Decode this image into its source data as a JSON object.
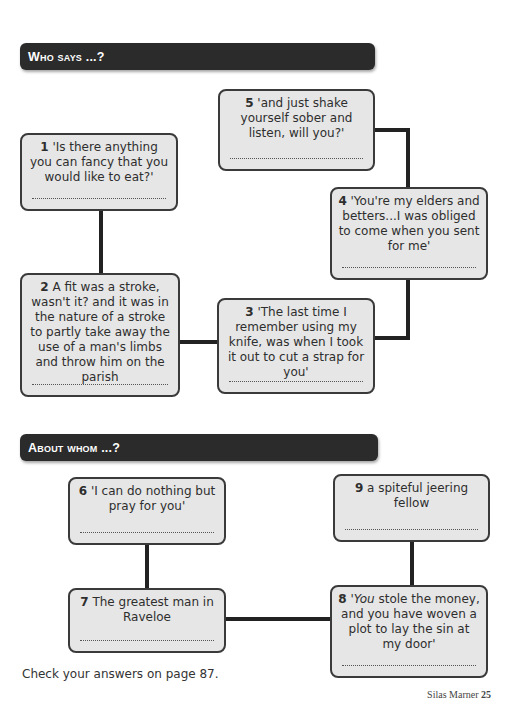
{
  "sections": [
    {
      "title": "Who says ...?",
      "boxes": [
        {
          "number": "5",
          "text": "'and just shake yourself sober and listen, will you?'"
        },
        {
          "number": "1",
          "text": "'Is there anything you can fancy that you would like to eat?'"
        },
        {
          "number": "4",
          "text": "'You're my elders and betters...I was obliged to come when you sent for me'"
        },
        {
          "number": "2",
          "text": "A fit was a stroke, wasn't it? and it was in the nature of a stroke to partly take away the use of a man's limbs and throw him on the parish"
        },
        {
          "number": "3",
          "text": "'The last time I remember using my knife, was when I took it out to cut a strap for you'"
        }
      ]
    },
    {
      "title": "About whom ...?",
      "boxes": [
        {
          "number": "6",
          "text": "'I can do nothing but pray for you'"
        },
        {
          "number": "9",
          "text": "a spiteful jeering fellow"
        },
        {
          "number": "7",
          "text": "The greatest man in Raveloe"
        },
        {
          "number": "8",
          "text_italic": "'You",
          "text": " stole the money, and you have woven a plot to lay the sin at my door'"
        }
      ]
    }
  ],
  "footer": {
    "note": "Check your answers on page 87.",
    "book_title": "Silas Marner",
    "page_number": "25"
  }
}
